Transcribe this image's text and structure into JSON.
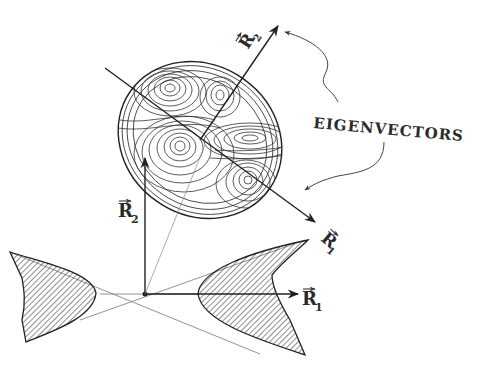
{
  "diagram": {
    "title_annotation": "EIGENVECTORS",
    "labels": {
      "R1_axis": "R",
      "R1_sub": "1",
      "R2_axis": "R",
      "R2_sub": "2",
      "R1_eigen": "R",
      "R1_eigen_sub": "1",
      "R2_eigen": "R",
      "R2_eigen_sub": "2"
    },
    "elements": [
      "contour-ellipse",
      "hyperbola-left-shaded",
      "hyperbola-right-shaded",
      "asymptote-lines",
      "axis-arrows",
      "eigenvector-arrows",
      "annotation-arrows"
    ],
    "colors": {
      "ink": "#2a2a2a",
      "faint_ink": "#777777",
      "background": "#ffffff"
    }
  }
}
